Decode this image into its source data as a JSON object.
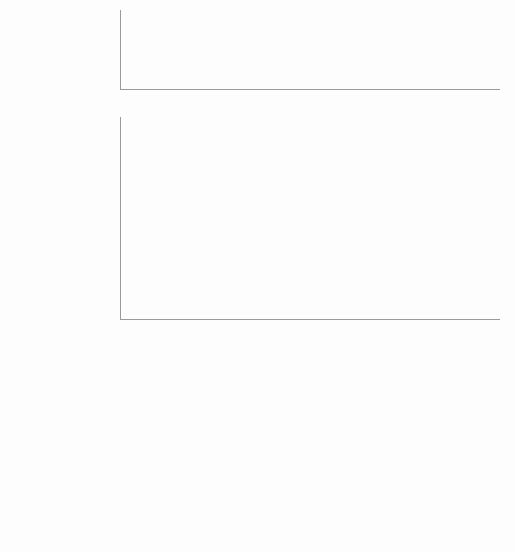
{
  "caption": {
    "prefix": "图",
    "number": "3",
    "text": "高引频文献"
  },
  "chart_data": [
    {
      "type": "bar",
      "title": "",
      "xlabel": "",
      "ylabel": "",
      "ylim": [
        0,
        12
      ],
      "yticks": [
        0,
        2,
        4,
        6,
        8,
        10,
        12
      ],
      "grid": true,
      "legend": "none",
      "bar_color": "#5b5b5b",
      "categories": [
        "CHINESE MEDICAL JOURNAL",
        "CLINICAL NUCLEAR MEDICINE",
        "BIOCHEMICAL AND BIOPHYSICAL RESEARCH...",
        "CELL BIOCHEMISTRY AND BIOPHYSICS",
        "MEDICINE",
        "DRUG DESIGN DEVELOPMENT AND THERAPY",
        "INTERNATIONAL JOURNAL OF MOLECULAR MEDICINE",
        "BMC CANCER",
        "ANNALS OF HEMATOLOGY",
        "INTERNATIONAL JOURNAL OF CLINICAL AND...",
        "SCIENTIFIC REPORTS",
        "ONCOLOGY REPORTS",
        "TUMOR BIOLOGY",
        "MEDICAL ONCOLOGY",
        "EXPERIMENTAL AND THERAPEUTIC MEDICINE",
        "LEUKEMIA & LYMPHOMA",
        "BLOOD",
        "PLOS ONE",
        "MOLECULAR MEDICINE REPORTS",
        "ONCOLOGY LETTERS"
      ],
      "values": [
        1.0,
        3.9,
        2.2,
        1.65,
        5.7,
        3.0,
        2.05,
        3.3,
        2.5,
        1.75,
        5.55,
        2.15,
        3.55,
        2.5,
        1.15,
        2.75,
        10.3,
        3.15,
        1.4,
        1.4
      ]
    },
    {
      "type": "bar",
      "title": "",
      "xlabel": "",
      "ylabel": "",
      "ylim": [
        0,
        80
      ],
      "yticks": [
        0,
        10,
        20,
        30,
        40,
        50,
        60,
        70,
        80
      ],
      "grid": true,
      "legend": "none",
      "bar_color": "#5b5b5b",
      "categories": [
        "CHINESE MEDICAL JOURNAL",
        "CLINICAL NUCLEAR MEDICINE",
        "BIOCHEMICAL AND BIOPHYSICAL RESEARCH...",
        "CELL BIOCHEMISTRY AND BIOPHYSICS",
        "MEDICINE",
        "DRUG DESIGN DEVELOPMENT AND THERAPY",
        "INTERNATIONAL JOURNAL OF MOLECULAR MEDICINE",
        "BMC CANCER",
        "ANNALS OF HEMATOLOGY",
        "INTERNATIONAL JOURNAL OF CLINICAL AND...",
        "SCIENTIFIC REPORTS",
        "ONCOLOGY REPORTS",
        "TUMOR BIOLOGY",
        "MEDICAL ONCOLOGY",
        "EXPERIMENTAL AND THERAPEUTIC MEDICINE",
        "LEUKEMIA & LYMPHOMA",
        "BLOOD",
        "PLOS ONE",
        "MOLECULAR MEDICINE REPORTS",
        "ONCOLOGY LETTERS"
      ],
      "values": [
        7,
        7,
        8,
        8,
        8,
        9,
        9.7,
        12,
        12.7,
        14,
        13.9,
        16.7,
        16.7,
        19.6,
        21.6,
        21.7,
        33.5,
        37.7,
        65.3,
        69.3
      ]
    }
  ]
}
